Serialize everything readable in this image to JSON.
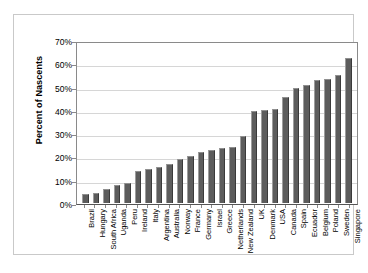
{
  "chart_data": {
    "type": "bar",
    "title": "",
    "xlabel": "",
    "ylabel": "Percent of Nascents",
    "ylim": [
      0,
      70
    ],
    "ytick_labels": [
      "70%",
      "60%",
      "50%",
      "40%",
      "30%",
      "20%",
      "10%",
      "0%"
    ],
    "ytick_values": [
      70,
      60,
      50,
      40,
      30,
      20,
      10,
      0
    ],
    "grid": true,
    "legend": "none",
    "orientation": "vertical",
    "bar_color": "#5c5c5c",
    "background_color": "#ffffff",
    "gridline_color": "#d6d6d6",
    "axis_color": "#8a8a8a",
    "categories": [
      "Brazil",
      "Hungary",
      "South Africa",
      "Uganda",
      "Peru",
      "Ireland",
      "Italy",
      "Argentina",
      "Australia",
      "Norway",
      "France",
      "Germany",
      "Israel",
      "Greece",
      "Netherlands",
      "New Zealand",
      "UK",
      "Denmark",
      "USA",
      "Canada",
      "Spain",
      "Ecuador",
      "Belgium",
      "Poland",
      "Sweden",
      "Singapore"
    ],
    "values": [
      4.0,
      4.5,
      6.0,
      8.0,
      8.5,
      14.0,
      15.0,
      15.5,
      17.0,
      19.0,
      20.5,
      22.0,
      23.0,
      24.0,
      24.5,
      29.0,
      40.0,
      40.5,
      41.0,
      46.0,
      50.0,
      51.5,
      53.5,
      54.0,
      55.5,
      63.0
    ]
  }
}
